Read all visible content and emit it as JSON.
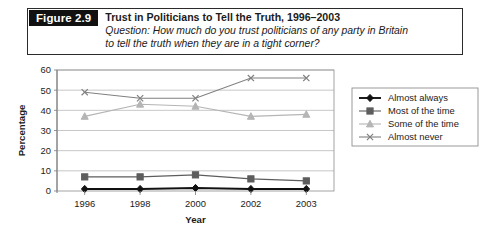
{
  "figure": {
    "number_label": "Figure 2.9",
    "title": "Trust in Politicians to Tell the Truth, 1996–2003",
    "question_line1": "Question: How much do you trust politicians of any party in Britain",
    "question_line2": "to tell the truth when they are in a tight corner?"
  },
  "chart_data": {
    "type": "line",
    "title": "Trust in Politicians to Tell the Truth, 1996–2003",
    "xlabel": "Year",
    "ylabel": "Percentage",
    "categories": [
      "1996",
      "1998",
      "2000",
      "2002",
      "2003"
    ],
    "ylim": [
      0,
      60
    ],
    "yticks": [
      0,
      10,
      20,
      30,
      40,
      50,
      60
    ],
    "grid": true,
    "legend_position": "right",
    "series": [
      {
        "name": "Almost always",
        "values": [
          1,
          1,
          1.5,
          1,
          1
        ],
        "color": "#111111",
        "marker": "diamond"
      },
      {
        "name": "Most of the time",
        "values": [
          7,
          7,
          8,
          6,
          5
        ],
        "color": "#5d5d5d",
        "marker": "square"
      },
      {
        "name": "Some of the time",
        "values": [
          37,
          43,
          42,
          37,
          38
        ],
        "color": "#b5b5b5",
        "marker": "triangle"
      },
      {
        "name": "Almost never",
        "values": [
          49,
          46,
          46,
          56,
          56
        ],
        "color": "#808080",
        "marker": "cross"
      }
    ]
  }
}
